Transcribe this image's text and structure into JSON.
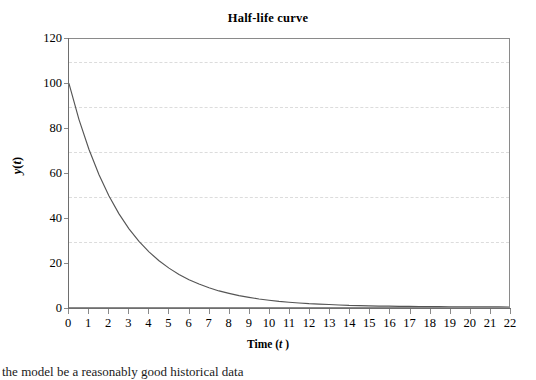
{
  "chart_data": {
    "type": "line",
    "title": "Half-life curve",
    "xlabel": "Time (t )",
    "xlabel_plain": "Time (t)",
    "ylabel": "y(t)",
    "ylabel_plain": "y(t)",
    "xlim": [
      0,
      22
    ],
    "ylim": [
      0,
      120
    ],
    "grid": "horizontal-dashed",
    "legend": "none",
    "equation": "y(t) = 100 * e^(-0.35t)",
    "line_color": "#555555",
    "x_ticks": [
      0,
      1,
      2,
      3,
      4,
      5,
      6,
      7,
      8,
      9,
      10,
      11,
      12,
      13,
      14,
      15,
      16,
      17,
      18,
      19,
      20,
      21,
      22
    ],
    "y_ticks": [
      0,
      20,
      40,
      60,
      80,
      100,
      120
    ],
    "x": [
      0,
      0.5,
      1,
      1.5,
      2,
      2.5,
      3,
      3.5,
      4,
      4.5,
      5,
      5.5,
      6,
      6.5,
      7,
      7.5,
      8,
      8.5,
      9,
      9.5,
      10,
      10.5,
      11,
      11.5,
      12,
      12.5,
      13,
      13.5,
      14,
      14.5,
      15,
      15.5,
      16,
      16.5,
      17,
      17.5,
      18,
      18.5,
      19,
      19.5,
      20,
      20.5,
      21,
      21.5,
      22
    ],
    "values": [
      100.0,
      83.9,
      70.5,
      59.2,
      49.7,
      41.7,
      35.0,
      29.4,
      24.7,
      20.7,
      17.4,
      14.6,
      12.2,
      10.3,
      8.6,
      7.2,
      6.1,
      5.1,
      4.3,
      3.6,
      3.0,
      2.5,
      2.1,
      1.8,
      1.5,
      1.3,
      1.1,
      0.9,
      0.7,
      0.6,
      0.5,
      0.4,
      0.4,
      0.3,
      0.3,
      0.2,
      0.2,
      0.2,
      0.1,
      0.1,
      0.1,
      0.1,
      0.1,
      0.1,
      0.0
    ],
    "series": [
      {
        "name": "Half-life decay",
        "values": [
          100.0,
          83.9,
          70.5,
          59.2,
          49.7,
          41.7,
          35.0,
          29.4,
          24.7,
          20.7,
          17.4,
          14.6,
          12.2,
          10.3,
          8.6,
          7.2,
          6.1,
          5.1,
          4.3,
          3.6,
          3.0,
          2.5,
          2.1,
          1.8,
          1.5,
          1.3,
          1.1,
          0.9,
          0.7,
          0.6,
          0.5,
          0.4,
          0.4,
          0.3,
          0.3,
          0.2,
          0.2,
          0.2,
          0.1,
          0.1,
          0.1,
          0.1,
          0.1,
          0.1,
          0.0
        ]
      }
    ]
  },
  "figure": {
    "title": "Half-life curve",
    "x_axis_title_prefix": "Time (",
    "x_axis_title_var": "t",
    "x_axis_title_suffix": " )",
    "y_axis_title_var": "y",
    "y_axis_title_open": "(",
    "y_axis_title_inner": "t",
    "y_axis_title_close": ")",
    "x_tick_labels": [
      "0",
      "1",
      "2",
      "3",
      "4",
      "5",
      "6",
      "7",
      "8",
      "9",
      "10",
      "11",
      "12",
      "13",
      "14",
      "15",
      "16",
      "17",
      "18",
      "19",
      "20",
      "21",
      "22"
    ],
    "y_tick_labels": [
      "120",
      "100",
      "80",
      "60",
      "40",
      "20",
      "0"
    ],
    "bottom_caption": "the model be a reasonably good historical data"
  },
  "colors": {
    "plot_border": "#8a8a8a",
    "axis_line": "#6e6e6e",
    "gridline": "#dcdcdc",
    "curve": "#555555",
    "background": "#ffffff",
    "text": "#000000"
  }
}
